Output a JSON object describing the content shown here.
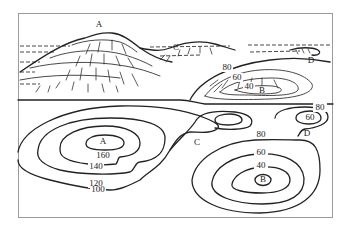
{
  "figure": {
    "title": "",
    "landscape_labels": {
      "peak": "A",
      "saddle": "C",
      "valley": "B",
      "cliff": "D",
      "contours": [
        "80",
        "60",
        "40"
      ]
    },
    "contour_map": {
      "hill": {
        "point_label": "A",
        "contours": [
          "160",
          "140",
          "120",
          "100"
        ]
      },
      "saddle_label": "C",
      "depression": {
        "point_label": "B",
        "contours": [
          "80",
          "60",
          "40"
        ]
      },
      "cliff": {
        "point_label": "D",
        "contours": [
          "80",
          "60"
        ]
      }
    }
  }
}
